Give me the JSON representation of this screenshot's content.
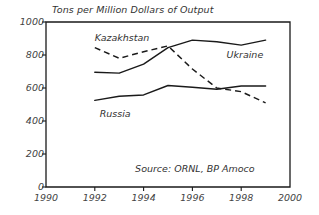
{
  "chart_data": {
    "type": "line",
    "title": "Tons per Million Dollars of Output",
    "xlabel": "",
    "ylabel": "",
    "xlim": [
      1990,
      2000
    ],
    "ylim": [
      0,
      1000
    ],
    "grid": false,
    "legend_position": "inline-labels",
    "xticks": [
      "1990",
      "1992",
      "1994",
      "1996",
      "1998",
      "2000"
    ],
    "yticks": [
      "0",
      "200",
      "400",
      "600",
      "800",
      "1000"
    ],
    "x": [
      1992,
      1993,
      1994,
      1995,
      1996,
      1997,
      1998,
      1999
    ],
    "series": [
      {
        "name": "Kazakhstan",
        "style": "dashed",
        "label_x": 1992.0,
        "label_y": 905,
        "values": [
          845,
          780,
          820,
          855,
          715,
          600,
          578,
          510
        ]
      },
      {
        "name": "Ukraine",
        "style": "solid",
        "label_x": 1997.4,
        "label_y": 800,
        "values": [
          695,
          690,
          745,
          845,
          890,
          880,
          860,
          890
        ]
      },
      {
        "name": "Russia",
        "style": "solid",
        "label_x": 1992.2,
        "label_y": 445,
        "values": [
          525,
          550,
          558,
          615,
          605,
          592,
          612,
          612
        ]
      }
    ],
    "annotations": [
      {
        "name": "source-note",
        "text": "Source: ORNL, BP Amoco",
        "x": 1996.1,
        "y": 110
      }
    ]
  }
}
